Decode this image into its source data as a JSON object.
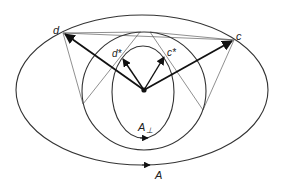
{
  "diagram": {
    "points": {
      "d": {
        "label": "d"
      },
      "c": {
        "label": "c"
      },
      "d_star": {
        "label": "d*"
      },
      "c_star": {
        "label": "c*"
      }
    },
    "curves": {
      "outer": {
        "label": "A"
      },
      "inner": {
        "label": "A",
        "subscript": "⊥"
      }
    },
    "colors": {
      "line": "#111111",
      "background": "#ffffff"
    }
  }
}
